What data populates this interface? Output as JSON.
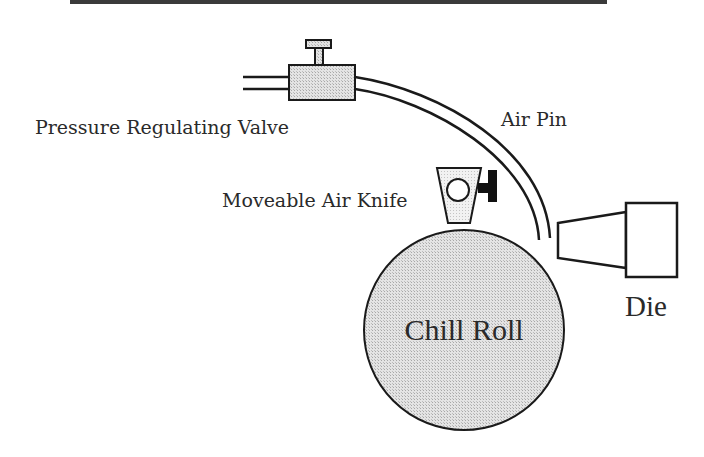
{
  "diagram": {
    "title": "",
    "labels": {
      "valve": "Pressure Regulating Valve",
      "air_pin": "Air Pin",
      "air_knife": "Moveable Air Knife",
      "chill_roll": "Chill Roll",
      "die": "Die"
    },
    "components": [
      {
        "id": "pressure-regulating-valve",
        "label": "Pressure Regulating Valve"
      },
      {
        "id": "air-pin",
        "label": "Air Pin"
      },
      {
        "id": "moveable-air-knife",
        "label": "Moveable Air Knife"
      },
      {
        "id": "chill-roll",
        "label": "Chill Roll"
      },
      {
        "id": "die",
        "label": "Die"
      }
    ],
    "colors": {
      "stroke": "#1a1a1a",
      "fill_shaded": "#d9d9d9",
      "fill_light": "#ececec",
      "top_rule": "#3a3a3a",
      "text": "#2a2a2a"
    }
  }
}
